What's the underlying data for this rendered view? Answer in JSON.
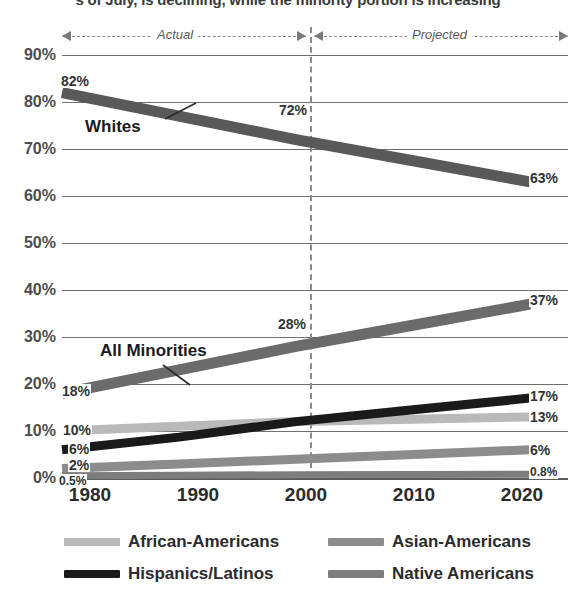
{
  "headline": "s of July, is declining, while the minority portion is increasing",
  "band": {
    "actual": "Actual",
    "projected": "Projected"
  },
  "colors": {
    "whites": "#595959",
    "all_minorities": "#6b6b6b",
    "african_americans": "#b9b9b9",
    "asian_americans": "#8c8c8c",
    "hispanics_latinos": "#1a1a1a",
    "native_americans": "#7d7d7d",
    "gridline": "#6f6f6f",
    "divider": "#8a8a8a"
  },
  "legend": {
    "items": [
      {
        "label": "African-Americans",
        "color": "#b9b9b9"
      },
      {
        "label": "Asian-Americans",
        "color": "#8c8c8c"
      },
      {
        "label": "Hispanics/Latinos",
        "color": "#1a1a1a"
      },
      {
        "label": "Native Americans",
        "color": "#7d7d7d"
      }
    ]
  },
  "annotations": {
    "whites": "Whites",
    "all_minorities": "All Minorities"
  },
  "chart_data": {
    "type": "line",
    "title": "",
    "xlabel": "",
    "ylabel": "",
    "x": [
      1980,
      1990,
      2000,
      2010,
      2020
    ],
    "xticklabels": [
      "1980",
      "1990",
      "2000",
      "2010",
      "2020"
    ],
    "yticklabels": [
      "0%",
      "10%",
      "20%",
      "30%",
      "40%",
      "50%",
      "60%",
      "70%",
      "80%",
      "90%"
    ],
    "ylim": [
      0,
      90
    ],
    "ytick_step": 10,
    "grid": true,
    "legend_position": "bottom",
    "divider_year": 2000,
    "divider_style": "dashed",
    "regions": [
      {
        "label": "Actual",
        "from": 1980,
        "to": 2000
      },
      {
        "label": "Projected",
        "from": 2000,
        "to": 2020
      }
    ],
    "series": [
      {
        "name": "Whites",
        "color": "#595959",
        "values": [
          82,
          77,
          72,
          67.5,
          63
        ],
        "labels": [
          {
            "x": 1980,
            "text": "82%"
          },
          {
            "x": 2000,
            "text": "72%"
          },
          {
            "x": 2020,
            "text": "63%"
          }
        ]
      },
      {
        "name": "All Minorities",
        "color": "#6b6b6b",
        "values": [
          18,
          23,
          28,
          32.5,
          37
        ],
        "labels": [
          {
            "x": 1980,
            "text": "18%"
          },
          {
            "x": 2000,
            "text": "28%"
          },
          {
            "x": 2020,
            "text": "37%"
          }
        ]
      },
      {
        "name": "Hispanics/Latinos",
        "color": "#1a1a1a",
        "values": [
          6,
          8.7,
          12,
          14.5,
          17
        ],
        "labels": [
          {
            "x": 1980,
            "text": "6%"
          },
          {
            "x": 2020,
            "text": "17%"
          }
        ]
      },
      {
        "name": "African-Americans",
        "color": "#b9b9b9",
        "values": [
          10,
          11,
          12,
          12.5,
          13
        ],
        "labels": [
          {
            "x": 1980,
            "text": "10%"
          },
          {
            "x": 2020,
            "text": "13%"
          }
        ]
      },
      {
        "name": "Asian-Americans",
        "color": "#8c8c8c",
        "values": [
          2,
          3,
          4,
          5,
          6
        ],
        "labels": [
          {
            "x": 1980,
            "text": "2%"
          },
          {
            "x": 2020,
            "text": "6%"
          }
        ]
      },
      {
        "name": "Native Americans",
        "color": "#7d7d7d",
        "values": [
          0.5,
          0.6,
          0.7,
          0.75,
          0.8
        ],
        "labels": [
          {
            "x": 1980,
            "text": "0.5%"
          },
          {
            "x": 2020,
            "text": "0.8%"
          }
        ]
      }
    ]
  }
}
